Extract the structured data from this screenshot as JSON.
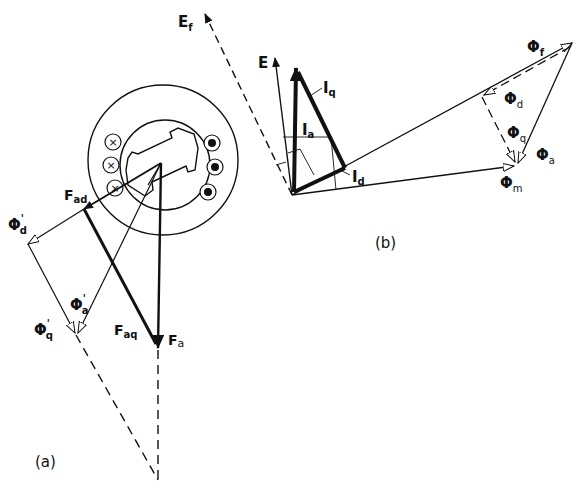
{
  "figure": {
    "panel_a": {
      "caption": "(a)",
      "labels": {
        "F_ad": {
          "main": "F",
          "sub": "ad"
        },
        "F_aq": {
          "main": "F",
          "sub": "aq"
        },
        "F_a": {
          "main": "F",
          "sub": "a"
        },
        "Phi_d_prime": {
          "main": "Φ",
          "sup": "'",
          "sub": "d"
        },
        "Phi_a_prime": {
          "main": "Φ",
          "sup": "'",
          "sub": "a"
        },
        "Phi_q_prime": {
          "main": "Φ",
          "sup": "'",
          "sub": "q"
        }
      },
      "conductors": {
        "cross_symbol": "×",
        "dot_symbol": "●",
        "count_each_side": 3
      }
    },
    "panel_b": {
      "caption": "(b)",
      "labels": {
        "E_f": {
          "main": "E",
          "sub": "f"
        },
        "E": {
          "main": "E"
        },
        "I_q": {
          "main": "I",
          "sub": "q"
        },
        "I_a": {
          "main": "I",
          "sub": "a"
        },
        "I_d": {
          "main": "I",
          "sub": "d"
        },
        "Phi_f": {
          "main": "Φ",
          "sub": "f"
        },
        "Phi_d": {
          "main": "Φ",
          "sub": "d"
        },
        "Phi_q": {
          "main": "Φ",
          "sub": "q"
        },
        "Phi_a": {
          "main": "Φ",
          "sub": "a"
        },
        "Phi_m": {
          "main": "Φ",
          "sub": "m"
        }
      }
    },
    "colors": {
      "ink": "#111111",
      "background": "#ffffff"
    }
  }
}
